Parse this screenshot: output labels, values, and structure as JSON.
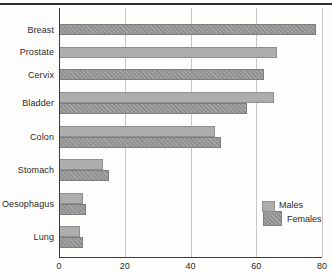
{
  "chart": {
    "colors": {
      "background": "#fdfdfb",
      "rule": "#2d2d2d",
      "axis": "#3c3c3c",
      "grid": "#c6c6c6",
      "males_fill": "#adadad",
      "males_border": "#8f8f8f",
      "females_fill": "#999999",
      "females_border": "#7d7d7d"
    },
    "legend": {
      "males_label": "Males",
      "females_label": "Females"
    }
  },
  "chart_data": {
    "type": "bar",
    "orientation": "horizontal",
    "title": "",
    "xlabel": "",
    "ylabel": "",
    "categories": [
      "Breast",
      "Prostate",
      "Cervix",
      "Bladder",
      "Colon",
      "Stomach",
      "Oesophagus",
      "Lung"
    ],
    "series": [
      {
        "name": "Males",
        "values": [
          null,
          66,
          null,
          65,
          47,
          13,
          7,
          6
        ]
      },
      {
        "name": "Females",
        "values": [
          78,
          null,
          62,
          57,
          49,
          15,
          8,
          7
        ]
      }
    ],
    "xlim": [
      0,
      80
    ],
    "xticks": [
      0,
      20,
      40,
      60,
      80
    ],
    "grid": true,
    "legend_position": "lower right"
  }
}
